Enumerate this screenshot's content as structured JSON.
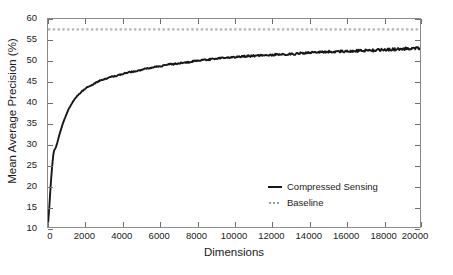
{
  "chart_data": {
    "type": "line",
    "title": "",
    "xlabel": "Dimensions",
    "ylabel": "Mean Average Precision (%)",
    "xlim": [
      0,
      20000
    ],
    "ylim": [
      10,
      60
    ],
    "xticks": [
      0,
      2000,
      4000,
      6000,
      8000,
      10000,
      12000,
      14000,
      16000,
      18000,
      20000
    ],
    "xtick_labels": [
      "0",
      "2000",
      "4000",
      "6000",
      "8000",
      "10000",
      "12000",
      "14000",
      "16000",
      "18000",
      "20000"
    ],
    "yticks": [
      10,
      15,
      20,
      25,
      30,
      35,
      40,
      45,
      50,
      55,
      60
    ],
    "ytick_labels": [
      "10",
      "15",
      "20",
      "25",
      "30",
      "35",
      "40",
      "45",
      "50",
      "55",
      "60"
    ],
    "grid": false,
    "legend_position": "center-right",
    "series": [
      {
        "name": "Compressed Sensing",
        "style": "solid",
        "color": "#171717",
        "x": [
          0,
          60,
          120,
          180,
          240,
          300,
          360,
          420,
          500,
          600,
          700,
          800,
          900,
          1000,
          1100,
          1200,
          1300,
          1400,
          1500,
          1600,
          1800,
          2000,
          2200,
          2400,
          2600,
          2800,
          3000,
          3200,
          3400,
          3600,
          3800,
          4000,
          4200,
          4400,
          4600,
          4800,
          5000,
          5200,
          5400,
          5600,
          5800,
          6000,
          6200,
          6400,
          6600,
          6800,
          7000,
          7200,
          7400,
          7600,
          7800,
          8000,
          8200,
          8400,
          8600,
          8800,
          9000,
          9200,
          9400,
          9600,
          9800,
          10000,
          10400,
          10800,
          11200,
          11600,
          12000,
          12400,
          12800,
          13200,
          13600,
          14000,
          14400,
          14800,
          15200,
          15600,
          16000,
          16400,
          16800,
          17200,
          17600,
          18000,
          18400,
          18800,
          19200,
          19600,
          20000
        ],
        "y": [
          10.9,
          14.2,
          18.6,
          22.4,
          25.6,
          28.1,
          28.8,
          29.2,
          30.4,
          32.1,
          33.6,
          35.0,
          36.2,
          37.3,
          38.3,
          39.2,
          39.9,
          40.6,
          41.2,
          41.7,
          42.6,
          43.3,
          43.9,
          44.3,
          44.8,
          45.3,
          45.5,
          45.8,
          46.2,
          46.3,
          46.6,
          46.8,
          47.1,
          47.3,
          47.4,
          47.6,
          47.8,
          48.1,
          48.2,
          48.4,
          48.6,
          48.7,
          48.8,
          49.1,
          49.2,
          49.2,
          49.4,
          49.5,
          49.6,
          49.7,
          49.9,
          50.0,
          50.1,
          50.2,
          50.3,
          50.4,
          50.5,
          50.6,
          50.7,
          50.8,
          50.8,
          50.9,
          51.0,
          51.1,
          51.2,
          51.3,
          51.4,
          51.5,
          51.5,
          51.6,
          51.8,
          51.9,
          52.0,
          52.1,
          52.2,
          52.2,
          52.3,
          52.4,
          52.4,
          52.5,
          52.5,
          52.6,
          52.7,
          52.8,
          52.9,
          53.0,
          53.0
        ]
      },
      {
        "name": "Baseline",
        "style": "dotted",
        "color": "#b4b4b4",
        "constant_y": 57.5
      }
    ]
  },
  "legend": {
    "entries": [
      {
        "label": "Compressed Sensing",
        "marker": "solid-line"
      },
      {
        "label": "Baseline",
        "marker": "dotted-line"
      }
    ]
  }
}
